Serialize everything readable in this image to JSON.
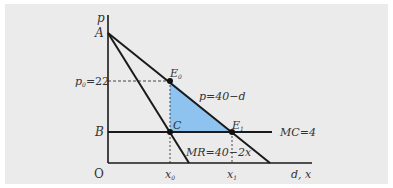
{
  "diagram": {
    "type": "monopoly-deadweight-loss",
    "axes": {
      "y_label": "p",
      "x_label": "d, x",
      "origin_label": "O"
    },
    "points": {
      "A": "A",
      "B": "B",
      "C": "C",
      "E0": "E",
      "E0_sub": "0",
      "E1": "E",
      "E1_sub": "1"
    },
    "price_label": "p",
    "price_sub": "0",
    "price_value": "=22",
    "curves": {
      "demand": "p=40−d",
      "marginal_revenue": "MR=40−2x",
      "marginal_cost": "MC=4"
    },
    "x_ticks": {
      "x0": "x",
      "x0_sub": "0",
      "x1": "x",
      "x1_sub": "1"
    },
    "colors": {
      "shaded_area": "#8fc3ef",
      "background": "#ebebeb",
      "lines": "#1a1a1a"
    }
  }
}
